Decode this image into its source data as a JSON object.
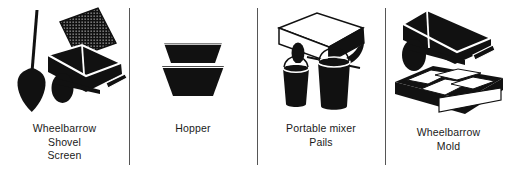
{
  "figure": {
    "kind": "tool-illustration-panels",
    "background_color": "#ffffff",
    "ink_color": "#000000",
    "divider_color": "#565656",
    "panel_count": 4
  },
  "panels": [
    {
      "id": "wheelbarrow-shovel-screen",
      "caption_lines": [
        "Wheelbarrow",
        "Shovel",
        "Screen"
      ],
      "items": [
        {
          "name": "shovel-icon",
          "label": "Shovel"
        },
        {
          "name": "screen-icon",
          "label": "Screen"
        },
        {
          "name": "wheelbarrow-icon",
          "label": "Wheelbarrow"
        }
      ]
    },
    {
      "id": "hopper",
      "caption_lines": [
        "Hopper"
      ],
      "items": [
        {
          "name": "hopper-icon",
          "label": "Hopper"
        }
      ]
    },
    {
      "id": "portable-mixer-pails",
      "caption_lines": [
        "Portable mixer",
        "Pails"
      ],
      "items": [
        {
          "name": "portable-mixer-icon",
          "label": "Portable mixer"
        },
        {
          "name": "pail-icon",
          "label": "Pails"
        }
      ]
    },
    {
      "id": "wheelbarrow-mold",
      "caption_lines": [
        "Wheelbarrow",
        "Mold"
      ],
      "items": [
        {
          "name": "wheelbarrow-icon",
          "label": "Wheelbarrow"
        },
        {
          "name": "mold-icon",
          "label": "Mold"
        }
      ]
    }
  ]
}
